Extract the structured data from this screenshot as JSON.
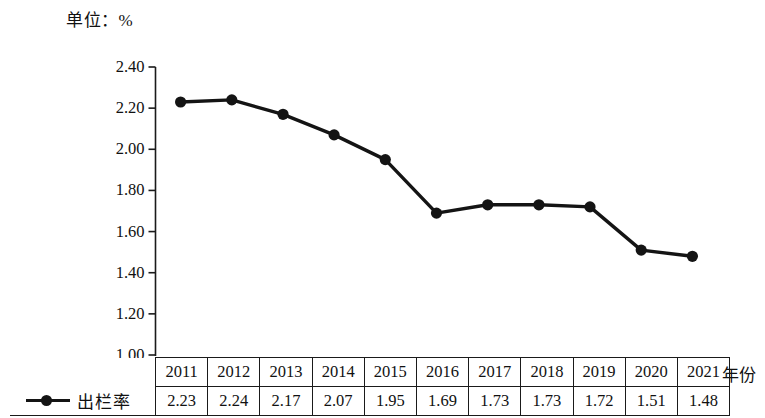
{
  "unit_caption": "单位：%",
  "axis_title_x": "年份",
  "legend": {
    "series_label": "出栏率",
    "marker": "line-dot-marker"
  },
  "y_axis": {
    "ticks": [
      "2.40",
      "2.20",
      "2.00",
      "1.80",
      "1.60",
      "1.40",
      "1.20",
      "1.00"
    ]
  },
  "table": {
    "header_label": "",
    "years": [
      "2011",
      "2012",
      "2013",
      "2014",
      "2015",
      "2016",
      "2017",
      "2018",
      "2019",
      "2020",
      "2021"
    ],
    "values": [
      "2.23",
      "2.24",
      "2.17",
      "2.07",
      "1.95",
      "1.69",
      "1.73",
      "1.73",
      "1.72",
      "1.51",
      "1.48"
    ]
  },
  "colors": {
    "line": "#141414",
    "marker": "#141414",
    "axis": "#1a1a1a",
    "background": "#ffffff"
  },
  "chart_data": {
    "type": "line",
    "title": "单位：%",
    "xlabel": "年份",
    "ylabel": "单位：%",
    "categories": [
      "2011",
      "2012",
      "2013",
      "2014",
      "2015",
      "2016",
      "2017",
      "2018",
      "2019",
      "2020",
      "2021"
    ],
    "series": [
      {
        "name": "出栏率",
        "values": [
          2.23,
          2.24,
          2.17,
          2.07,
          1.95,
          1.69,
          1.73,
          1.73,
          1.72,
          1.51,
          1.48
        ]
      }
    ],
    "ylim": [
      1.0,
      2.4
    ],
    "ytick_step": 0.2,
    "yticks": [
      1.0,
      1.2,
      1.4,
      1.6,
      1.8,
      2.0,
      2.2,
      2.4
    ],
    "grid": false,
    "legend_position": "bottom-left-table",
    "marker_style": "filled-circle",
    "line_color": "#141414"
  }
}
